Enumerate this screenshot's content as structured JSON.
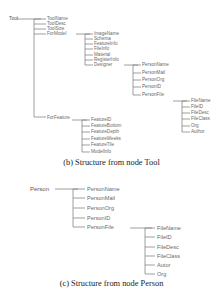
{
  "diagram_b": {
    "caption": "(b) Structure from node Tool",
    "root": "Tool",
    "children": [
      "ToolName",
      "ToolDesc",
      "ToolSize",
      "ForModel",
      "ForFeature"
    ],
    "formodel_children": [
      "ImageName",
      "Schema",
      "FeatureInfo",
      "FileInfo",
      "Material",
      "RegisterInfo",
      "Designer"
    ],
    "designer_children": [
      "PersonName",
      "PersonMail",
      "PersonOrg",
      "PersonID",
      "PersonFile"
    ],
    "personfile_children": [
      "FileName",
      "FileID",
      "FileDesc",
      "FileClass",
      "Org",
      "Author"
    ],
    "forfeature_children": [
      "FeatureID",
      "FeatureBottom",
      "FeatureDepth",
      "FeatureWeeks",
      "FeatureTile",
      "ModelInfo"
    ]
  },
  "diagram_c": {
    "caption": "(c) Structure from node Person",
    "root": "Person",
    "children": [
      "PersonName",
      "PersonMail",
      "PersonOrg",
      "PersonID",
      "PersonFile"
    ],
    "personfile_children": [
      "FileName",
      "FileID",
      "FileDesc",
      "FileClass",
      "Autor",
      "Org"
    ]
  },
  "colors": {
    "line": "#777777",
    "label": "#6a6a6a",
    "caption": "#222222"
  }
}
